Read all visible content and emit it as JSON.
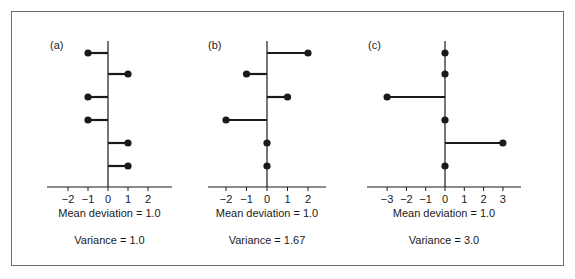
{
  "figure": {
    "border_color": "#6e6e6e",
    "ink_color": "#1a1a1a"
  },
  "chart_data": [
    {
      "type": "scatter",
      "title": "(a)",
      "description": "Deviations from mean shown as horizontal lollipops",
      "x": [
        -1,
        1,
        -1,
        -1,
        1,
        1
      ],
      "xticks": [
        -2,
        -1,
        0,
        1,
        2
      ],
      "xtick_labels": [
        "−2",
        "−1",
        "0",
        "1",
        "2"
      ],
      "xlim": [
        -2.8,
        3.2
      ],
      "mean_deviation_label": "Mean deviation = 1.0",
      "variance_label": "Variance = 1.0",
      "mean_deviation": 1.0,
      "variance": 1.0
    },
    {
      "type": "scatter",
      "title": "(b)",
      "description": "Deviations from mean shown as horizontal lollipops",
      "x": [
        2,
        -1,
        1,
        -2,
        0,
        0
      ],
      "xticks": [
        -2,
        -1,
        0,
        1,
        2
      ],
      "xtick_labels": [
        "−2",
        "−1",
        "0",
        "1",
        "2"
      ],
      "xlim": [
        -2.95,
        2.95
      ],
      "mean_deviation_label": "Mean deviation = 1.0",
      "variance_label": "Variance = 1.67",
      "mean_deviation": 1.0,
      "variance": 1.67
    },
    {
      "type": "scatter",
      "title": "(c)",
      "description": "Deviations from mean shown as horizontal lollipops",
      "x": [
        0,
        0,
        -3,
        0,
        3,
        0
      ],
      "xticks": [
        -3,
        -2,
        -1,
        0,
        1,
        2,
        3
      ],
      "xtick_labels": [
        "−3",
        "−2",
        "−1",
        "0",
        "1",
        "2",
        "3"
      ],
      "xlim": [
        -4.0,
        4.0
      ],
      "mean_deviation_label": "Mean deviation = 1.0",
      "variance_label": "Variance = 3.0",
      "mean_deviation": 1.0,
      "variance": 3.0
    }
  ],
  "layout": {
    "panels": [
      {
        "axis_x": 108,
        "unit": 20,
        "line_x0": 47,
        "line_x1": 172
      },
      {
        "axis_x": 267,
        "unit": 20.5,
        "line_x0": 208,
        "line_x1": 326
      },
      {
        "axis_x": 445,
        "unit": 19.3,
        "line_x0": 367,
        "line_x1": 521
      }
    ],
    "row_y": [
      53,
      74,
      97,
      120,
      143,
      166
    ],
    "axis_top": 41,
    "baseline_y": 187
  }
}
